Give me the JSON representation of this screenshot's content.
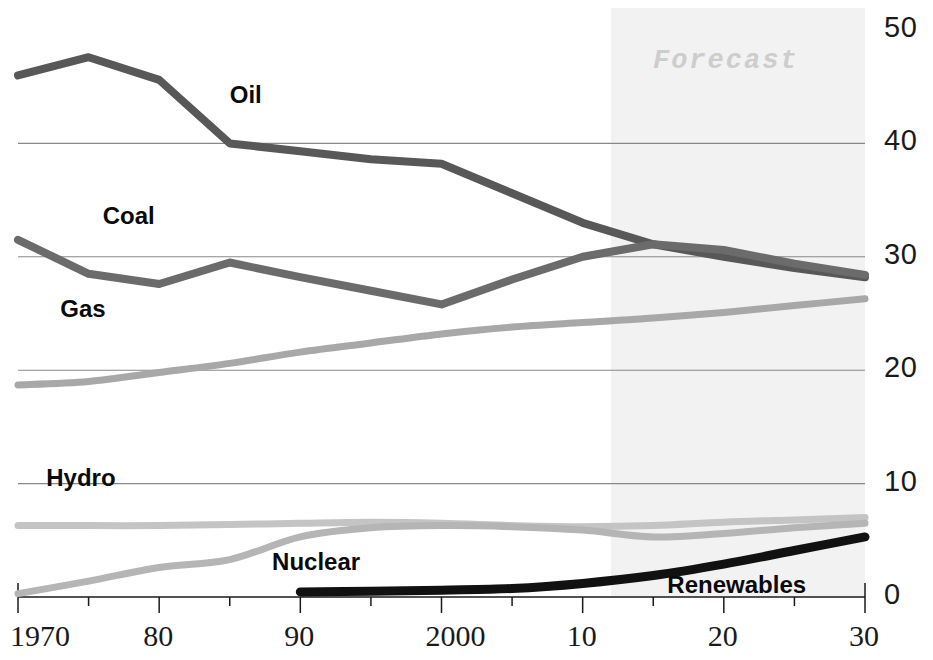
{
  "chart_data": {
    "type": "line",
    "title": "",
    "xlabel": "",
    "ylabel": "",
    "xlim": [
      1970,
      2030
    ],
    "ylim": [
      0,
      50
    ],
    "grid": "horizontal gridlines at 10, 20, 30, 40",
    "legend": "inline series labels on plot",
    "x_tick_labels": [
      "1970",
      "80",
      "90",
      "2000",
      "10",
      "20",
      "30"
    ],
    "x_tick_values": [
      1970,
      1980,
      1990,
      2000,
      2010,
      2020,
      2030
    ],
    "x_minor_tick_step": 5,
    "y_tick_labels": [
      "0",
      "10",
      "20",
      "30",
      "40",
      "50"
    ],
    "y_tick_values": [
      0,
      10,
      20,
      30,
      40,
      50
    ],
    "annotations": [
      {
        "text": "Forecast",
        "x": 2021,
        "y": 47,
        "note": "shaded band 2012-2030"
      }
    ],
    "shaded_region": {
      "label": "Forecast",
      "x_start": 2012,
      "x_end": 2030,
      "color": "#f2f2f2"
    },
    "series": [
      {
        "name": "Oil",
        "color": "#585858",
        "label_x": 1985,
        "label_y": 44.3,
        "x": [
          1970,
          1975,
          1980,
          1985,
          1990,
          1995,
          2000,
          2005,
          2010,
          2015,
          2020,
          2025,
          2030
        ],
        "values": [
          46.0,
          47.6,
          45.6,
          40.0,
          39.3,
          38.6,
          38.2,
          35.6,
          33.0,
          31.1,
          30.0,
          29.0,
          28.2
        ]
      },
      {
        "name": "Coal",
        "color": "#6b6b6b",
        "label_x": 1976,
        "label_y": 33.6,
        "x": [
          1970,
          1975,
          1980,
          1985,
          1990,
          1995,
          2000,
          2005,
          2010,
          2015,
          2020,
          2025,
          2030
        ],
        "values": [
          31.5,
          28.5,
          27.6,
          29.5,
          28.2,
          27.0,
          25.8,
          28.0,
          30.0,
          31.1,
          30.6,
          29.4,
          28.4
        ]
      },
      {
        "name": "Gas",
        "color": "#a8a8a8",
        "label_x": 1973,
        "label_y": 25.4,
        "x": [
          1970,
          1975,
          1980,
          1985,
          1990,
          1995,
          2000,
          2005,
          2010,
          2015,
          2020,
          2025,
          2030
        ],
        "values": [
          18.7,
          19.0,
          19.8,
          20.6,
          21.6,
          22.4,
          23.2,
          23.8,
          24.2,
          24.6,
          25.1,
          25.7,
          26.3
        ]
      },
      {
        "name": "Hydro",
        "color": "#c4c4c4",
        "label_x": 1972,
        "label_y": 10.5,
        "x": [
          1970,
          1975,
          1980,
          1985,
          1990,
          1995,
          2000,
          2005,
          2010,
          2015,
          2020,
          2025,
          2030
        ],
        "values": [
          6.3,
          6.3,
          6.3,
          6.4,
          6.5,
          6.6,
          6.5,
          6.3,
          6.2,
          6.3,
          6.6,
          6.8,
          7.0
        ]
      },
      {
        "name": "Nuclear",
        "color": "#b5b5b5",
        "label_x": 1988,
        "label_y": 3.1,
        "x": [
          1970,
          1975,
          1980,
          1985,
          1990,
          1995,
          2000,
          2005,
          2010,
          2015,
          2020,
          2025,
          2030
        ],
        "values": [
          0.3,
          1.4,
          2.6,
          3.3,
          5.3,
          6.1,
          6.3,
          6.2,
          5.9,
          5.3,
          5.6,
          6.1,
          6.5
        ]
      },
      {
        "name": "Renewables",
        "color": "#111111",
        "label_x": 2016,
        "label_y": 1.1,
        "x": [
          1990,
          1995,
          2000,
          2005,
          2010,
          2015,
          2020,
          2025,
          2030
        ],
        "values": [
          0.45,
          0.5,
          0.6,
          0.75,
          1.2,
          1.9,
          2.9,
          4.1,
          5.3
        ]
      }
    ]
  }
}
